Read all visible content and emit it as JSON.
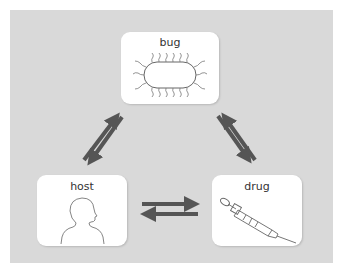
{
  "diagram": {
    "type": "triangle-interaction",
    "background_color": "#d9d9d9",
    "arrow_color": "#555555",
    "nodes": [
      {
        "id": "bug",
        "label": "bug",
        "icon": "bacterium-icon"
      },
      {
        "id": "host",
        "label": "host",
        "icon": "human-head-icon"
      },
      {
        "id": "drug",
        "label": "drug",
        "icon": "syringe-icon"
      }
    ],
    "edges": [
      {
        "from": "bug",
        "to": "host",
        "bidirectional": true
      },
      {
        "from": "bug",
        "to": "drug",
        "bidirectional": true
      },
      {
        "from": "host",
        "to": "drug",
        "bidirectional": true
      }
    ]
  }
}
